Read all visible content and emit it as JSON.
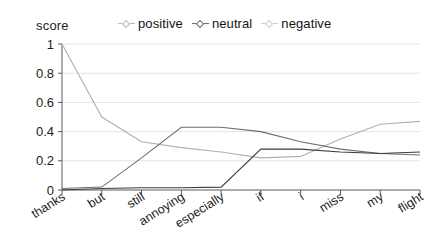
{
  "axis_title": "score",
  "legend": {
    "items": [
      {
        "label": "positive",
        "color": "#b9b9b9",
        "marker": "diamond-marker-icon"
      },
      {
        "label": "neutral",
        "color": "#6e6e6e",
        "marker": "diamond-marker-icon"
      },
      {
        "label": "negative",
        "color": "#cfcfcf",
        "marker": "diamond-marker-icon"
      }
    ]
  },
  "chart_data": {
    "type": "line",
    "title": "",
    "xlabel": "",
    "ylabel": "score",
    "ylim": [
      0,
      1
    ],
    "yticks": [
      "0",
      "0.2",
      "0.4",
      "0.6",
      "0.8",
      "1"
    ],
    "ytick_values": [
      0,
      0.2,
      0.4,
      0.6,
      0.8,
      1
    ],
    "grid": true,
    "legend_position": "top",
    "categories": [
      "thanks",
      "but",
      "still",
      "annoying",
      "especially",
      "if",
      "i",
      "miss",
      "my",
      "flight"
    ],
    "series": [
      {
        "name": "positive",
        "color": "#b0b0b0",
        "values": [
          1.0,
          0.5,
          0.33,
          0.29,
          0.26,
          0.22,
          0.23,
          0.35,
          0.45,
          0.47
        ]
      },
      {
        "name": "neutral",
        "color": "#6e6e6e",
        "values": [
          0.01,
          0.02,
          0.22,
          0.43,
          0.43,
          0.4,
          0.33,
          0.28,
          0.25,
          0.24
        ]
      },
      {
        "name": "negative",
        "color": "#3c3c3c",
        "values": [
          0.0,
          0.01,
          0.015,
          0.015,
          0.02,
          0.28,
          0.28,
          0.26,
          0.25,
          0.26
        ]
      }
    ]
  },
  "geometry": {
    "plot_left": 62,
    "plot_right": 420,
    "plot_top": 44,
    "plot_bottom": 190
  }
}
